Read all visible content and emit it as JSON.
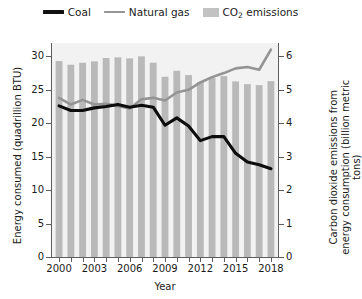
{
  "chart_data": {
    "type": "bar",
    "title": "",
    "xlabel": "Year",
    "ylabel": "Energy consumed (quadrillion BTU)",
    "y2label": "Carbon dioxide emissions from energy consumption (billion metric tons)",
    "grid": false,
    "legend_position": "top",
    "ylim": [
      0,
      32
    ],
    "y2lim": [
      0,
      6.4
    ],
    "xlim": [
      1999.4,
      2018.6
    ],
    "yticks": [
      0,
      5,
      10,
      15,
      20,
      25,
      30
    ],
    "ytick_labels": [
      "0",
      "5",
      "10",
      "15",
      "20",
      "25",
      "30"
    ],
    "y2ticks": [
      0,
      1,
      2,
      3,
      4,
      5,
      6
    ],
    "y2tick_labels": [
      "0",
      "1",
      "2",
      "3",
      "4",
      "5",
      "6"
    ],
    "categories": [
      2000,
      2001,
      2002,
      2003,
      2004,
      2005,
      2006,
      2007,
      2008,
      2009,
      2010,
      2011,
      2012,
      2013,
      2014,
      2015,
      2016,
      2017,
      2018
    ],
    "xtick_labels": [
      "2000",
      "2003",
      "2006",
      "2009",
      "2012",
      "2015",
      "2018"
    ],
    "xtick_values": [
      2000,
      2003,
      2006,
      2009,
      2012,
      2015,
      2018
    ],
    "series": [
      {
        "name": "CO2 emissions",
        "legend_label": "CO",
        "legend_label_sub": "2",
        "legend_label_tail": " emissions",
        "kind": "bar",
        "axis": "right",
        "unit": "billion metric tons",
        "color": "#b9b9b9",
        "values": [
          5.86,
          5.75,
          5.81,
          5.85,
          5.95,
          5.97,
          5.94,
          6.0,
          5.81,
          5.39,
          5.57,
          5.44,
          5.23,
          5.36,
          5.41,
          5.25,
          5.17,
          5.14,
          5.26
        ]
      },
      {
        "name": "Coal",
        "legend_label": "Coal",
        "kind": "line",
        "axis": "left",
        "unit": "quadrillion BTU",
        "color": "#0d0d0d",
        "values": [
          22.6,
          21.9,
          21.9,
          22.3,
          22.5,
          22.8,
          22.4,
          22.7,
          22.4,
          19.7,
          20.8,
          19.6,
          17.4,
          18.0,
          18.0,
          15.5,
          14.2,
          13.8,
          13.2
        ]
      },
      {
        "name": "Natural gas",
        "legend_label": "Natural gas",
        "kind": "line",
        "axis": "left",
        "unit": "quadrillion BTU",
        "color": "#949494",
        "values": [
          23.8,
          22.8,
          23.5,
          22.8,
          22.9,
          22.6,
          22.2,
          23.6,
          23.8,
          23.4,
          24.6,
          25.0,
          26.1,
          26.9,
          27.5,
          28.2,
          28.4,
          28.0,
          31.0
        ]
      }
    ]
  },
  "legend": {
    "entries": [
      {
        "label": "Coal",
        "style": "line-black"
      },
      {
        "label": "Natural gas",
        "style": "line-gray"
      },
      {
        "label": "CO2 emissions",
        "style": "bar-gray"
      }
    ],
    "coal_label": "Coal",
    "gas_label": "Natural gas",
    "co2_label_main": "CO",
    "co2_label_sub": "2",
    "co2_label_tail": " emissions"
  },
  "axes": {
    "left_title": "Energy consumed (quadrillion BTU)",
    "right_title_line1": "Carbon dioxide emissions from",
    "right_title_line2": "energy consumption (billion metric tons)",
    "x_title": "Year"
  },
  "colors": {
    "coal": "#0d0d0d",
    "natural_gas": "#949494",
    "co2_bars": "#b9b9b9",
    "plot_background": "#f2f2f2",
    "axis": "#5d5d5d",
    "text": "#1b1b1b"
  }
}
